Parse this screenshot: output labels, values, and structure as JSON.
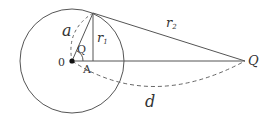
{
  "diagram": {
    "type": "geometry",
    "colors": {
      "stroke": "#555555",
      "text": "#333333",
      "point": "#111111"
    },
    "circle": {
      "cx": 72,
      "cy": 61,
      "r": 52
    },
    "points": {
      "O": {
        "x": 72,
        "y": 61,
        "label": "0"
      },
      "P": {
        "x": 93,
        "y": 13
      },
      "A": {
        "x": 93,
        "y": 61,
        "label": "A"
      },
      "Q": {
        "x": 245,
        "y": 61,
        "label": "Q"
      }
    },
    "labels": {
      "a": "a",
      "r1": "r",
      "r1_sub": "1",
      "r2": "r",
      "r2_sub": "2",
      "theta": "Q",
      "d": "d",
      "origin": "0",
      "A": "A",
      "Q": "Q"
    }
  }
}
